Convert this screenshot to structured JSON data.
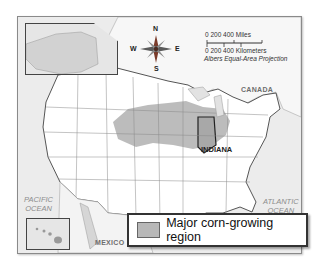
{
  "map": {
    "title_region": "United States",
    "labels": {
      "canada": "CANADA",
      "mexico": "MEXICO",
      "indiana": "INDIANA",
      "pacific_ocean_1": "PACIFIC",
      "pacific_ocean_2": "OCEAN",
      "atlantic_ocean_1": "ATLANTIC",
      "atlantic_ocean_2": "OCEAN"
    },
    "compass": {
      "n": "N",
      "s": "S",
      "e": "E",
      "w": "W"
    },
    "scale": {
      "miles": "0    200   400 Miles",
      "km": "0  200 400 Kilometers",
      "projection": "Albers Equal-Area Projection"
    },
    "insets": [
      "Alaska",
      "Hawaii"
    ],
    "colors": {
      "corn_region": "#b8b8b8",
      "land": "#ffffff",
      "water": "#e9e9e9",
      "border": "#555555"
    }
  },
  "legend": {
    "items": [
      {
        "label": "Major corn-growing region",
        "color": "#b8b8b8"
      }
    ]
  }
}
